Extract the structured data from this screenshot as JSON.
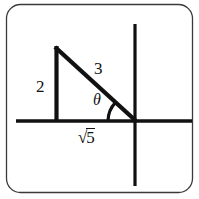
{
  "figure": {
    "frame": {
      "shape": "rounded-rectangle",
      "stroke_color": "#3a3a3a",
      "fill_color": "#ffffff",
      "corner_radius": 14
    },
    "axes": {
      "stroke_color": "#111111",
      "x_axis": {
        "label": "",
        "from_x": 16,
        "to_x": 192,
        "y": 121
      },
      "y_axis": {
        "label": "",
        "x": 135,
        "from_y": 24,
        "to_y": 186
      },
      "origin": {
        "x": 135,
        "y": 121
      }
    },
    "triangle": {
      "stroke_color": "#111111",
      "vertices": {
        "apex": {
          "x": 56,
          "y": 47
        },
        "right_angle": {
          "x": 56,
          "y": 121
        },
        "theta_vertex": {
          "x": 135,
          "y": 121
        }
      }
    },
    "angle_arc": {
      "radius": 27,
      "stroke_color": "#111111"
    },
    "labels": {
      "opposite_side": "2",
      "hypotenuse": "3",
      "angle": "θ",
      "adjacent_radical_sign": "√",
      "adjacent_radicand": "5",
      "adjacent_side_full": "√5"
    }
  }
}
